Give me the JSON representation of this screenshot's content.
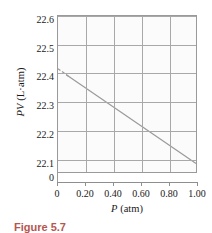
{
  "figure": {
    "caption": "Figure 5.7"
  },
  "chart_data": {
    "type": "line",
    "title": "",
    "xlabel": "P (atm)",
    "xlabel_symbol": "P",
    "xlabel_units": "(atm)",
    "ylabel": "PV (L·atm)",
    "ylabel_symbol": "PV",
    "ylabel_units": "(L·atm)",
    "xlim": [
      0,
      1.0
    ],
    "ylim": [
      22.05,
      22.6
    ],
    "xticks": [
      0,
      0.2,
      0.4,
      0.6,
      0.8,
      1.0
    ],
    "xticklabels": [
      "0",
      "0.20",
      "0.40",
      "0.60",
      "0.80",
      "1.00"
    ],
    "yticks": [
      22.1,
      22.2,
      22.3,
      22.4,
      22.5,
      22.6
    ],
    "yticklabels": [
      "22.1",
      "22.2",
      "22.3",
      "22.4",
      "22.5",
      "22.6"
    ],
    "y_axis_break_label": "0",
    "grid": true,
    "legend": null,
    "series": [
      {
        "name": "measured",
        "style": "solid",
        "color": "#9a9a9a",
        "x": [
          0.06,
          1.0
        ],
        "y": [
          22.393,
          22.08
        ]
      },
      {
        "name": "extrapolation",
        "style": "dashed",
        "color": "#9a9a9a",
        "x": [
          0.0,
          0.09
        ],
        "y": [
          22.414,
          22.383
        ]
      }
    ]
  }
}
